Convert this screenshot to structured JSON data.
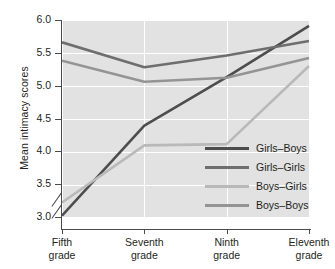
{
  "chart_data": {
    "type": "line",
    "title": "",
    "xlabel": "",
    "ylabel": "Mean intimacy scores",
    "categories": [
      "Fifth grade",
      "Seventh grade",
      "Ninth grade",
      "Eleventh grade"
    ],
    "ylim": [
      3.0,
      6.0
    ],
    "yticks": [
      "3.0",
      "3.5",
      "4.0",
      "4.5",
      "5.0",
      "5.5",
      "6.0"
    ],
    "y_axis_break": true,
    "grid": "horizontal-and-vertical-white",
    "legend_position": "inside-lower-right",
    "series": [
      {
        "name": "Girls-Boys",
        "values": [
          3.02,
          4.39,
          5.13,
          5.91
        ],
        "color": "#4d4d4d"
      },
      {
        "name": "Girls-Girls",
        "values": [
          5.66,
          5.28,
          5.46,
          5.68
        ],
        "color": "#6e6e6e"
      },
      {
        "name": "Boys-Girls",
        "values": [
          3.22,
          4.09,
          4.11,
          5.3
        ],
        "color": "#b9b9b9"
      },
      {
        "name": "Boys-Boys",
        "values": [
          5.38,
          5.06,
          5.12,
          5.42
        ],
        "color": "#949494"
      }
    ]
  },
  "axis": {
    "y_title": "Mean intimacy scores",
    "y_tick_labels": [
      "6.0",
      "5.5",
      "5.0",
      "4.5",
      "4.0",
      "3.5",
      "3.0"
    ],
    "x_tick_labels": [
      {
        "line1": "Fifth",
        "line2": "grade"
      },
      {
        "line1": "Seventh",
        "line2": "grade"
      },
      {
        "line1": "Ninth",
        "line2": "grade"
      },
      {
        "line1": "Eleventh",
        "line2": "grade"
      }
    ]
  },
  "legend": {
    "items": [
      {
        "label": "Girls–Boys",
        "color": "#4d4d4d"
      },
      {
        "label": "Girls–Girls",
        "color": "#6e6e6e"
      },
      {
        "label": "Boys–Girls",
        "color": "#b9b9b9"
      },
      {
        "label": "Boys–Boys",
        "color": "#949494"
      }
    ]
  },
  "style": {
    "plot_background": "#e2e2e2",
    "gridline_color": "#ffffff",
    "axis_color": "#4a4a4a",
    "text_color": "#231f20"
  }
}
